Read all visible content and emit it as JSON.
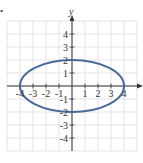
{
  "chart_data": {
    "type": "line",
    "title": "",
    "subtitle": "",
    "xlabel": "x",
    "ylabel": "y",
    "xlim": [
      -5,
      5
    ],
    "ylim": [
      -5,
      5
    ],
    "grid": true,
    "legend": null,
    "x_ticks": [
      -4,
      -3,
      -2,
      -1,
      1,
      2,
      3,
      4
    ],
    "y_ticks": [
      -4,
      -3,
      -2,
      -1,
      1,
      2,
      3,
      4
    ],
    "x_tick_labels": [
      "-4",
      "-3",
      "-2",
      "-1",
      "1",
      "2",
      "3",
      "4"
    ],
    "y_tick_labels": [
      "-4",
      "-3",
      "-2",
      "-1",
      "1",
      "2",
      "3",
      "4"
    ],
    "series": [
      {
        "name": "ellipse",
        "shape": "ellipse",
        "equation": "x^2/16 + y^2/4 = 1",
        "center": [
          0,
          0
        ],
        "semi_major_x": 4,
        "semi_minor_y": 2,
        "key_points": [
          [
            -4,
            0
          ],
          [
            4,
            0
          ],
          [
            0,
            2
          ],
          [
            0,
            -2
          ]
        ],
        "color": "#4a6a9a"
      }
    ]
  },
  "colors": {
    "grid": "#d8d8d8",
    "axis": "#333333",
    "curve": "#4a6a9a"
  },
  "marker": "•"
}
